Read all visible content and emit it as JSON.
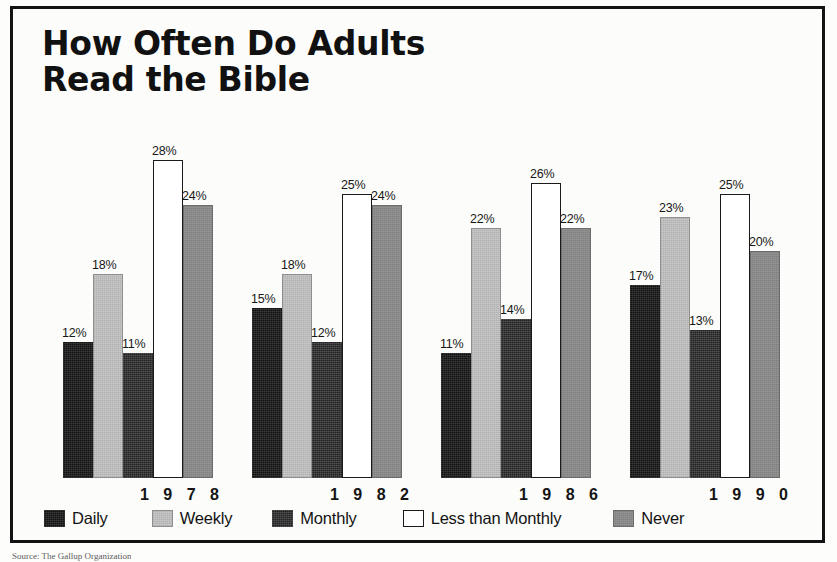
{
  "chart_data": {
    "type": "bar",
    "title": "How Often Do Adults\nRead the Bible",
    "xlabel": "",
    "ylabel": "",
    "ylim": [
      0,
      30
    ],
    "grid": false,
    "legend_position": "bottom",
    "value_suffix": "%",
    "categories": [
      "1978",
      "1982",
      "1986",
      "1990"
    ],
    "series": [
      {
        "name": "Daily",
        "color": "#121212",
        "values": [
          12,
          15,
          11,
          17
        ]
      },
      {
        "name": "Weekly",
        "color": "#c9c9c9",
        "values": [
          18,
          18,
          22,
          23
        ]
      },
      {
        "name": "Monthly",
        "color": "#232323",
        "values": [
          11,
          12,
          14,
          13
        ]
      },
      {
        "name": "Less than Monthly",
        "color": "#ffffff",
        "values": [
          28,
          25,
          26,
          25
        ]
      },
      {
        "name": "Never",
        "color": "#8d8d8d",
        "values": [
          24,
          24,
          22,
          20
        ]
      }
    ],
    "data_labels": [
      [
        "12%",
        "18%",
        "11%",
        "28%",
        "24%"
      ],
      [
        "15%",
        "18%",
        "12%",
        "25%",
        "24%"
      ],
      [
        "11%",
        "22%",
        "14%",
        "26%",
        "22%"
      ],
      [
        "17%",
        "23%",
        "13%",
        "25%",
        "20%"
      ]
    ]
  },
  "title": {
    "line1": "How Often Do Adults",
    "line2": "Read the Bible",
    "full": "How Often Do Adults\nRead the Bible"
  },
  "legend": {
    "items": [
      {
        "label": "Daily",
        "swatch": "black-swatch"
      },
      {
        "label": "Weekly",
        "swatch": "light-gray-swatch"
      },
      {
        "label": "Monthly",
        "swatch": "dark-gray-swatch"
      },
      {
        "label": "Less than Monthly",
        "swatch": "white-outline-swatch"
      },
      {
        "label": "Never",
        "swatch": "medium-gray-swatch"
      }
    ]
  },
  "axis": {
    "years": [
      "1 9 7 8",
      "1 9 8 2",
      "1 9 8 6",
      "1 9 9 0"
    ]
  },
  "source": {
    "text": "Source: The Gallup Organization"
  }
}
